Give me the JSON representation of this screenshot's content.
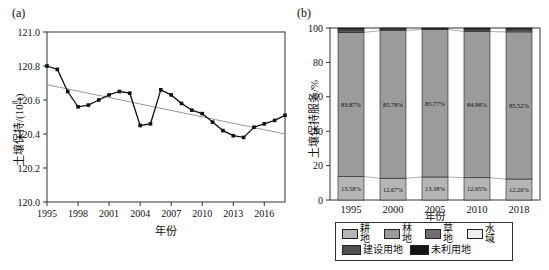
{
  "panel_labels": {
    "a": "(a)",
    "b": "(b)"
  },
  "chart_data": [
    {
      "id": "soil-retention-trend-line-chart",
      "type": "line",
      "xlabel": "年份",
      "ylabel": "土壤保持/(10⁸t)",
      "ylabel_parts": {
        "prefix": "土壤保持/(10",
        "sup": "8",
        "suffix": "t)"
      },
      "xlim": [
        1995,
        2018
      ],
      "ylim": [
        120.0,
        121.0
      ],
      "xticks": [
        1995,
        1998,
        2001,
        2004,
        2007,
        2010,
        2013,
        2016
      ],
      "yticks": [
        120.0,
        120.2,
        120.4,
        120.6,
        120.8,
        121.0
      ],
      "x": [
        1995,
        1996,
        1997,
        1998,
        1999,
        2000,
        2001,
        2002,
        2003,
        2004,
        2005,
        2006,
        2007,
        2008,
        2009,
        2010,
        2011,
        2012,
        2013,
        2014,
        2015,
        2016,
        2017,
        2018
      ],
      "y": [
        120.8,
        120.78,
        120.65,
        120.56,
        120.57,
        120.6,
        120.63,
        120.65,
        120.64,
        120.45,
        120.46,
        120.66,
        120.63,
        120.58,
        120.54,
        120.52,
        120.47,
        120.42,
        120.39,
        120.38,
        120.44,
        120.46,
        120.48,
        120.51
      ],
      "trend": {
        "x": [
          1995,
          2018
        ],
        "y": [
          120.69,
          120.4
        ]
      },
      "grid": false,
      "line_color": "#111111",
      "trend_color": "#999999"
    },
    {
      "id": "land-use-soil-retention-stacked-bars",
      "type": "bar",
      "stacked": true,
      "percent": true,
      "xlabel": "年份",
      "ylabel": "土壤保持服务/%",
      "ylim": [
        0,
        100
      ],
      "yticks": [
        0,
        20,
        40,
        60,
        80,
        100
      ],
      "categories": [
        "1995",
        "2000",
        "2005",
        "2010",
        "2018"
      ],
      "legend_position": "bottom",
      "series": [
        {
          "id": "cultivated-land",
          "name": "耕地",
          "color": "#b5b5b5",
          "values": [
            13.58,
            12.67,
            13.38,
            12.95,
            12.2
          ],
          "labels": [
            "13.58%",
            "12.67%",
            "13.38%",
            "12.95%",
            "12.20%"
          ]
        },
        {
          "id": "forest-land",
          "name": "林地",
          "color": "#9b9b9b",
          "values": [
            83.87,
            85.78,
            85.77,
            84.98,
            85.52
          ],
          "labels": [
            "83.87%",
            "85.78%",
            "85.77%",
            "84.98%",
            "85.52%"
          ]
        },
        {
          "id": "grassland",
          "name": "草地",
          "color": "#6e6e6e",
          "values": [
            0.9,
            0.6,
            0.3,
            0.8,
            0.9
          ]
        },
        {
          "id": "water-area",
          "name": "水域",
          "color": "#f0f0f0",
          "values": [
            0.5,
            0.3,
            0.2,
            0.4,
            0.5
          ]
        },
        {
          "id": "construction-land",
          "name": "建设用地",
          "color": "#4f4f4f",
          "values": [
            0.7,
            0.4,
            0.2,
            0.5,
            0.6
          ]
        },
        {
          "id": "unused-land",
          "name": "未利用地",
          "color": "#141414",
          "values": [
            0.45,
            0.25,
            0.15,
            0.37,
            0.28
          ]
        }
      ],
      "legend_rows": [
        [
          0,
          1,
          2,
          3
        ],
        [
          4,
          5
        ]
      ]
    }
  ]
}
